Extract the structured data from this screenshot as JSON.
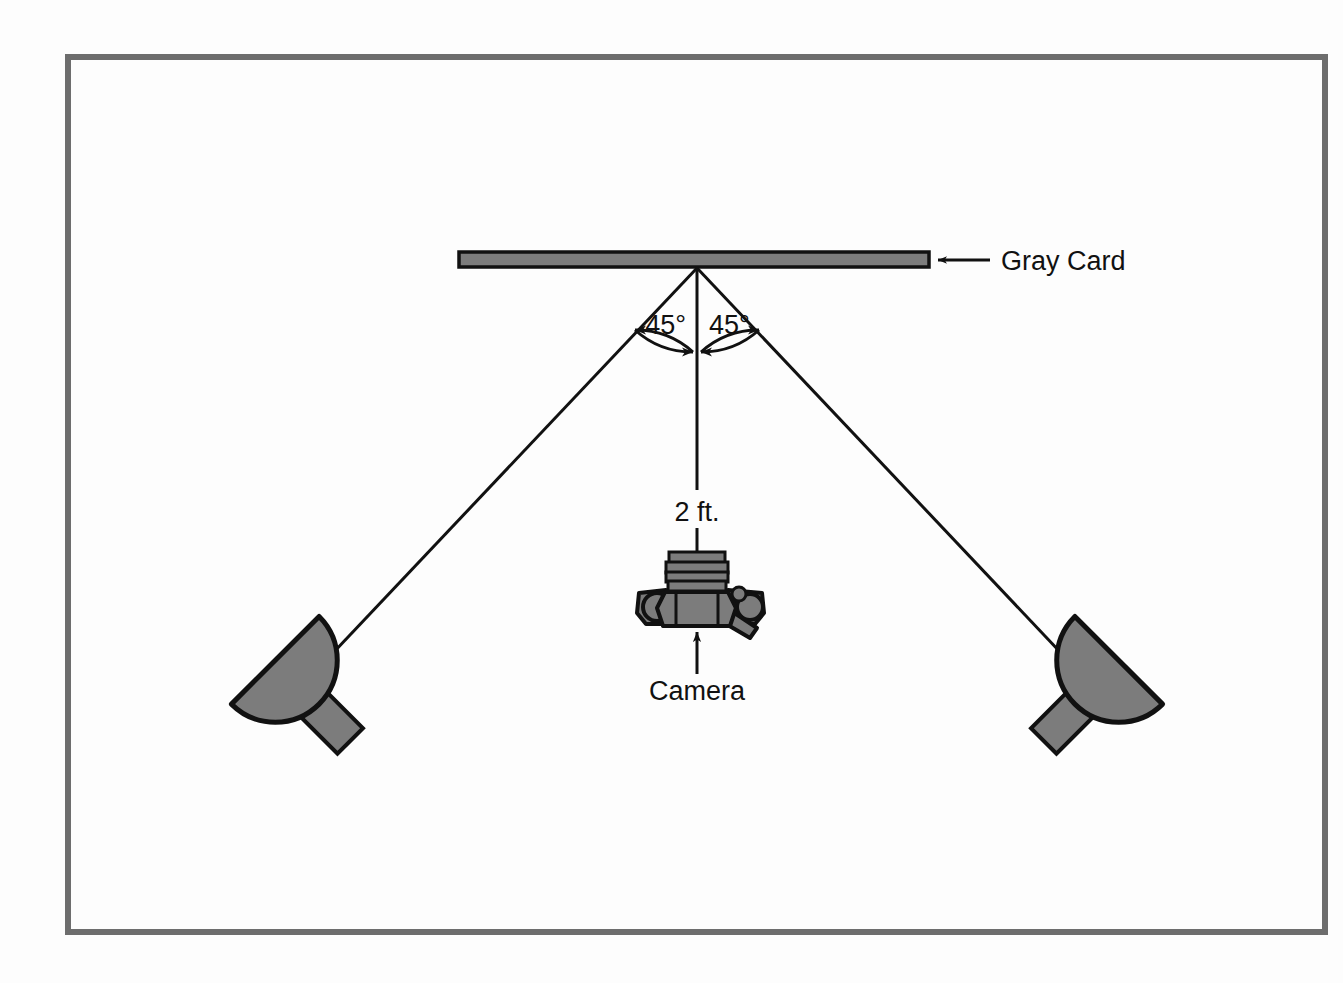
{
  "diagram": {
    "background_color": "#fdfdfd",
    "border": {
      "color": "#6d6d6d",
      "x": 68,
      "y": 57,
      "width": 1257,
      "height": 875,
      "stroke_width": 6
    },
    "colors": {
      "gray_fill": "#7c7c7c",
      "outline": "#111111",
      "line": "#111111",
      "text": "#111111",
      "border": "#6d6d6d"
    },
    "labels": {
      "gray_card": "Gray Card",
      "camera": "Camera",
      "distance": "2 ft.",
      "angle_left": "45°",
      "angle_right": "45°"
    },
    "gray_card": {
      "x": 459,
      "y": 252,
      "width": 470,
      "height": 15
    },
    "apex": {
      "x": 697,
      "y": 268
    },
    "camera": {
      "center_x": 697,
      "body_top": 590,
      "body_bottom": 624,
      "lens_top": 553
    },
    "lights": [
      {
        "name": "left-light",
        "cx": 288,
        "cy": 673,
        "rotation": -45
      },
      {
        "name": "right-light",
        "cx": 1106,
        "cy": 673,
        "rotation": 45
      }
    ],
    "rays": [
      {
        "name": "left-ray",
        "x1": 697,
        "y1": 268,
        "x2": 315,
        "y2": 672
      },
      {
        "name": "right-ray",
        "x1": 697,
        "y1": 268,
        "x2": 1079,
        "y2": 672
      },
      {
        "name": "center-axis",
        "x1": 697,
        "y1": 268,
        "x2": 697,
        "y2": 553
      }
    ],
    "callouts": {
      "gray_card_arrow": {
        "x1": 990,
        "y1": 261,
        "x2": 936,
        "y2": 261
      },
      "camera_arrow": {
        "x1": 697,
        "y1": 674,
        "x2": 697,
        "y2": 631
      }
    }
  }
}
